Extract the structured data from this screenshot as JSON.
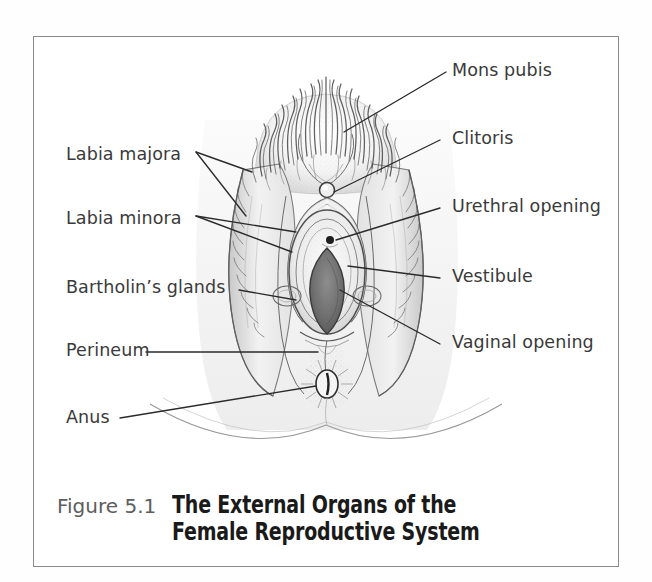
{
  "figure": {
    "number": "Figure 5.1",
    "title_line1": "The External Organs of the",
    "title_line2": "Female Reproductive System"
  },
  "illustration": {
    "subject": "external female genitalia anatomical line drawing",
    "style": "pen-and-ink stipple shading, grayscale"
  },
  "labels_left": [
    {
      "id": "labia-majora",
      "text": "Labia majora"
    },
    {
      "id": "labia-minora",
      "text": "Labia minora"
    },
    {
      "id": "bartholins-glands",
      "text": "Bartholin’s glands"
    },
    {
      "id": "perineum",
      "text": "Perineum"
    },
    {
      "id": "anus",
      "text": "Anus"
    }
  ],
  "labels_right": [
    {
      "id": "mons-pubis",
      "text": "Mons pubis"
    },
    {
      "id": "clitoris",
      "text": "Clitoris"
    },
    {
      "id": "urethral-opening",
      "text": "Urethral opening"
    },
    {
      "id": "vestibule",
      "text": "Vestibule"
    },
    {
      "id": "vaginal-opening",
      "text": "Vaginal opening"
    }
  ],
  "colors": {
    "frame": "#8a8a8a",
    "label_text": "#3a3a3a",
    "figure_number": "#5d5d5d",
    "title_text": "#1a1a1a",
    "leader_line": "#2b2b2b",
    "background": "#ffffff"
  }
}
